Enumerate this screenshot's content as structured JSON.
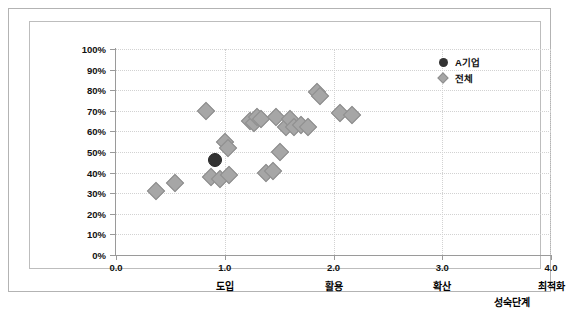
{
  "chart_data": {
    "type": "scatter",
    "title": "",
    "xlabel": "성숙단계",
    "ylabel": "준비도",
    "xlim": [
      0.0,
      4.0
    ],
    "ylim": [
      0,
      100
    ],
    "grid": true,
    "legend_position": "top-right",
    "x_ticks": [
      "0.0",
      "1.0",
      "2.0",
      "3.0",
      "4.0"
    ],
    "x_tick_values": [
      0.0,
      1.0,
      2.0,
      3.0,
      4.0
    ],
    "x_stage_labels": [
      "",
      "도입",
      "활용",
      "확산",
      "최적화"
    ],
    "y_ticks": [
      "0%",
      "10%",
      "20%",
      "30%",
      "40%",
      "50%",
      "60%",
      "70%",
      "80%",
      "90%",
      "100%"
    ],
    "y_tick_values": [
      0,
      10,
      20,
      30,
      40,
      50,
      60,
      70,
      80,
      90,
      100
    ],
    "series": [
      {
        "name": "A기업",
        "marker": "circle",
        "color": "#333333",
        "points": [
          {
            "x": 0.91,
            "y": 46
          }
        ]
      },
      {
        "name": "전체",
        "marker": "diamond",
        "color": "#a6a6a6",
        "points": [
          {
            "x": 0.37,
            "y": 31
          },
          {
            "x": 0.54,
            "y": 35
          },
          {
            "x": 0.83,
            "y": 70
          },
          {
            "x": 0.87,
            "y": 38
          },
          {
            "x": 0.96,
            "y": 37
          },
          {
            "x": 1.0,
            "y": 55
          },
          {
            "x": 1.03,
            "y": 52
          },
          {
            "x": 1.04,
            "y": 39
          },
          {
            "x": 1.23,
            "y": 65
          },
          {
            "x": 1.27,
            "y": 64
          },
          {
            "x": 1.3,
            "y": 67
          },
          {
            "x": 1.33,
            "y": 66
          },
          {
            "x": 1.38,
            "y": 40
          },
          {
            "x": 1.44,
            "y": 41
          },
          {
            "x": 1.47,
            "y": 67
          },
          {
            "x": 1.51,
            "y": 50
          },
          {
            "x": 1.56,
            "y": 62
          },
          {
            "x": 1.6,
            "y": 66
          },
          {
            "x": 1.64,
            "y": 62
          },
          {
            "x": 1.7,
            "y": 63
          },
          {
            "x": 1.77,
            "y": 62
          },
          {
            "x": 1.85,
            "y": 79
          },
          {
            "x": 1.88,
            "y": 77
          },
          {
            "x": 2.06,
            "y": 69
          },
          {
            "x": 2.17,
            "y": 68
          }
        ]
      }
    ]
  },
  "legend": {
    "entries": [
      {
        "label": "A기업",
        "marker": "circle"
      },
      {
        "label": "전체",
        "marker": "diamond"
      }
    ]
  },
  "axis_titles": {
    "y_chars": [
      "준",
      "비",
      "도"
    ],
    "x": "성숙단계"
  }
}
